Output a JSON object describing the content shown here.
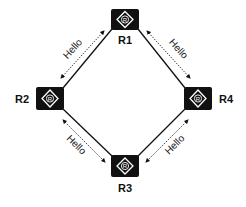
{
  "diagram": {
    "title": "",
    "routers": [
      {
        "id": "R1",
        "label": "R1",
        "icon": "router-icon",
        "icon_glyph": "R"
      },
      {
        "id": "R2",
        "label": "R2",
        "icon": "router-icon",
        "icon_glyph": "R"
      },
      {
        "id": "R3",
        "label": "R3",
        "icon": "router-icon",
        "icon_glyph": "R"
      },
      {
        "id": "R4",
        "label": "R4",
        "icon": "router-icon",
        "icon_glyph": "R"
      }
    ],
    "links": [
      {
        "from": "R1",
        "to": "R2",
        "type": "solid"
      },
      {
        "from": "R1",
        "to": "R4",
        "type": "solid"
      },
      {
        "from": "R2",
        "to": "R3",
        "type": "solid"
      },
      {
        "from": "R4",
        "to": "R3",
        "type": "solid"
      }
    ],
    "messages": [
      {
        "between": [
          "R1",
          "R2"
        ],
        "label": "Hello",
        "style": "dashed-bidirectional-arrow"
      },
      {
        "between": [
          "R1",
          "R4"
        ],
        "label": "Hello",
        "style": "dashed-bidirectional-arrow"
      },
      {
        "between": [
          "R2",
          "R3"
        ],
        "label": "Hello",
        "style": "dashed-bidirectional-arrow"
      },
      {
        "between": [
          "R4",
          "R3"
        ],
        "label": "Hello",
        "style": "dashed-bidirectional-arrow"
      }
    ],
    "colors": {
      "router_fill": "#111111",
      "router_symbol": "#ffffff",
      "line": "#111111"
    }
  }
}
